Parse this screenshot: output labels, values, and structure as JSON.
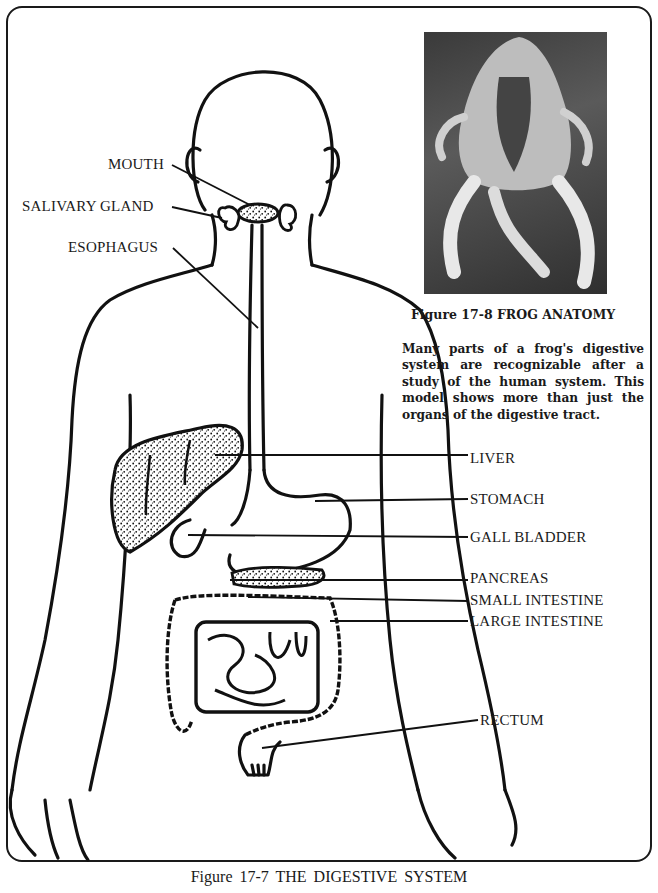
{
  "figure": {
    "caption": "Figure 17-7  THE  DIGESTIVE  SYSTEM",
    "labels": {
      "mouth": "MOUTH",
      "salivary_gland": "SALIVARY GLAND",
      "esophagus": "ESOPHAGUS",
      "liver": "LIVER",
      "stomach": "STOMACH",
      "gall_bladder": "GALL BLADDER",
      "pancreas": "PANCREAS",
      "small_intestine": "SMALL INTESTINE",
      "large_intestine": "LARGE INTESTINE",
      "rectum": "RECTUM"
    }
  },
  "inset": {
    "photo_description": "Frog anatomy model photograph",
    "caption": "Figure 17-8  FROG  ANATOMY",
    "text": "Many parts of a frog's digestive system are recognizable after a study of the human system. This model shows more than just the organs of the digestive tract."
  },
  "colors": {
    "ink": "#1a1a1a",
    "paper": "#ffffff"
  }
}
